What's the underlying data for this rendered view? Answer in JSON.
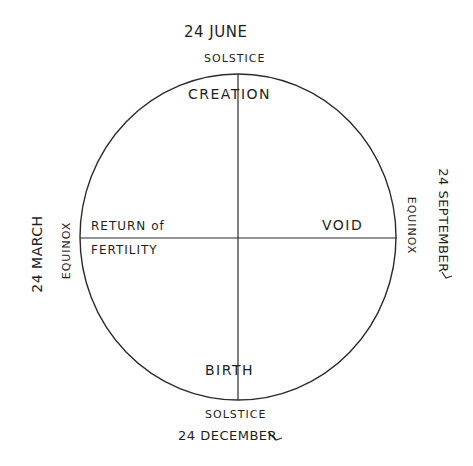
{
  "diagram": {
    "type": "seasonal-cycle-wheel",
    "ink_color": "#1e1e1e",
    "background": "#ffffff",
    "circle": {
      "cx": 238,
      "cy": 237,
      "rx": 158,
      "ry": 163
    },
    "top": {
      "date": "24 JUNE",
      "marker": "SOLSTICE",
      "quadrant": "CREATION"
    },
    "bottom": {
      "date": "24 DECEMBER",
      "marker": "SOLSTICE",
      "quadrant": "BIRTH"
    },
    "left": {
      "date": "24 MARCH",
      "marker": "EQUINOX",
      "quadrant_line1": "RETURN of",
      "quadrant_line2": "FERTILITY"
    },
    "right": {
      "date": "24 SEPTEMBER",
      "marker": "EQUINOX",
      "quadrant": "VOID"
    }
  }
}
